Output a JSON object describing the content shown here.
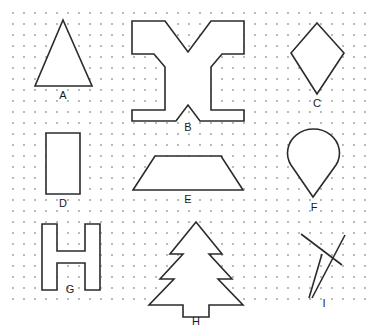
{
  "canvas": {
    "width": 376,
    "height": 335,
    "background_color": "#ffffff",
    "stroke_color": "#2b2b2b",
    "label_color": "#1a1a1a"
  },
  "grid": {
    "type": "dot-grid",
    "dot_color": "#9a9a9a",
    "dot_radius": 0.9,
    "spacing_x": 11,
    "spacing_y": 11,
    "origin_x": 13,
    "origin_y": 13,
    "cols": 33,
    "rows": 27
  },
  "shapes": [
    {
      "id": "A",
      "label": "A",
      "name": "triangle",
      "closed": true,
      "label_x": 63,
      "label_y": 99,
      "points": "63,20 92,86 35,86"
    },
    {
      "id": "B",
      "label": "B",
      "name": "cross-x-shape",
      "closed": true,
      "label_x": 188,
      "label_y": 131,
      "points": "132,21 165,21 188,52 211,21 244,21 244,54 222,54 211,67 211,110 244,110 244,121 200,121 188,105 176,121 132,121 132,110 165,110 165,67 154,54 132,54"
    },
    {
      "id": "C",
      "label": "C",
      "name": "kite",
      "closed": true,
      "label_x": 317,
      "label_y": 107,
      "points": "317,23 344,53 317,94 291,53"
    },
    {
      "id": "D",
      "label": "D",
      "name": "rectangle",
      "closed": true,
      "label_x": 63,
      "label_y": 207,
      "points": "46,133 80,133 80,194 46,194"
    },
    {
      "id": "E",
      "label": "E",
      "name": "trapezoid",
      "closed": true,
      "label_x": 188,
      "label_y": 203,
      "points": "155,156 221,156 243,190 133,190"
    },
    {
      "id": "F",
      "label": "F",
      "name": "teardrop",
      "closed": true,
      "path": "M 313 197 L 291 165 A 26 24 0 1 1 336 165 Z",
      "label_x": 314,
      "label_y": 211
    },
    {
      "id": "G",
      "label": "G",
      "name": "letter-h-shape",
      "closed": true,
      "label_x": 70,
      "label_y": 293,
      "points": "42,224 57,224 57,251 85,251 85,224 100,224 100,290 85,290 85,263 57,263 57,290 42,290"
    },
    {
      "id": "H",
      "label": "H",
      "name": "christmas-tree",
      "closed": true,
      "label_x": 196,
      "label_y": 325,
      "points": "196,222 222,254 209,254 232,279 218,279 243,305 209,305 209,317 183,317 183,305 149,305 174,279 160,279 183,254 170,254"
    },
    {
      "id": "I",
      "label": "I",
      "name": "open-stick-figure",
      "closed": false,
      "label_x": 324,
      "label_y": 307,
      "segments": [
        "M 301 234 L 342 265",
        "M 345 235 L 312 298",
        "M 322 254 L 309 298"
      ]
    }
  ]
}
